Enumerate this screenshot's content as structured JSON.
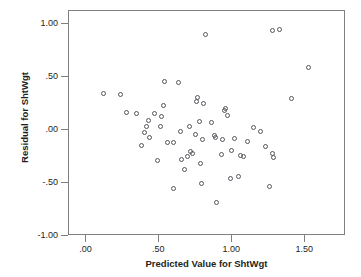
{
  "chart_data": {
    "type": "scatter",
    "title": "",
    "xlabel": "Predicted Value for ShtWgt",
    "ylabel": "Residual for ShtWgt",
    "xlim": [
      -0.12,
      1.78
    ],
    "ylim": [
      -1.0,
      1.12
    ],
    "grid": false,
    "legend": null,
    "marker": "open-circle",
    "marker_color": "#55555c",
    "xticks": [
      0.0,
      0.5,
      1.0,
      1.5
    ],
    "xtick_labels": [
      ".00",
      ".50",
      "1.00",
      "1.50"
    ],
    "yticks": [
      -1.0,
      -0.5,
      0.0,
      0.5,
      1.0
    ],
    "ytick_labels": [
      "-1.00",
      "-.50",
      ".00",
      ".50",
      "1.00"
    ],
    "series": [
      {
        "name": "residuals",
        "points": [
          [
            0.12,
            0.345
          ],
          [
            0.235,
            0.332
          ],
          [
            0.275,
            0.168
          ],
          [
            0.345,
            0.155
          ],
          [
            0.375,
            -0.145
          ],
          [
            0.395,
            -0.025
          ],
          [
            0.41,
            0.03
          ],
          [
            0.425,
            0.092
          ],
          [
            0.435,
            -0.075
          ],
          [
            0.465,
            0.15
          ],
          [
            0.49,
            -0.29
          ],
          [
            0.505,
            0.035
          ],
          [
            0.515,
            0.128
          ],
          [
            0.525,
            0.225
          ],
          [
            0.535,
            0.455
          ],
          [
            0.555,
            -0.118
          ],
          [
            0.595,
            -0.115
          ],
          [
            0.6,
            -0.555
          ],
          [
            0.63,
            0.445
          ],
          [
            0.645,
            -0.018
          ],
          [
            0.655,
            -0.275
          ],
          [
            0.67,
            -0.37
          ],
          [
            0.695,
            -0.255
          ],
          [
            0.705,
            0.03
          ],
          [
            0.715,
            -0.205
          ],
          [
            0.725,
            -0.225
          ],
          [
            0.745,
            -0.04
          ],
          [
            0.755,
            0.265
          ],
          [
            0.76,
            0.305
          ],
          [
            0.775,
            0.075
          ],
          [
            0.785,
            -0.315
          ],
          [
            0.79,
            -0.505
          ],
          [
            0.795,
            -0.095
          ],
          [
            0.805,
            0.245
          ],
          [
            0.815,
            0.895
          ],
          [
            0.86,
            0.065
          ],
          [
            0.875,
            -0.055
          ],
          [
            0.885,
            -0.075
          ],
          [
            0.89,
            -0.685
          ],
          [
            0.925,
            -0.235
          ],
          [
            0.935,
            -0.095
          ],
          [
            0.945,
            0.185
          ],
          [
            0.955,
            0.2
          ],
          [
            0.965,
            0.14
          ],
          [
            0.985,
            -0.455
          ],
          [
            0.995,
            -0.19
          ],
          [
            1.015,
            -0.08
          ],
          [
            1.045,
            -0.44
          ],
          [
            1.055,
            -0.245
          ],
          [
            1.08,
            -0.255
          ],
          [
            1.105,
            -0.105
          ],
          [
            1.145,
            0.02
          ],
          [
            1.195,
            -0.02
          ],
          [
            1.225,
            -0.155
          ],
          [
            1.255,
            -0.535
          ],
          [
            1.275,
            -0.225
          ],
          [
            1.285,
            -0.265
          ],
          [
            1.275,
            0.935
          ],
          [
            1.325,
            0.945
          ],
          [
            1.405,
            0.295
          ],
          [
            1.525,
            0.585
          ]
        ]
      }
    ]
  },
  "axis": {
    "x_title": "Predicted Value for ShtWgt",
    "y_title": "Residual for ShtWgt"
  }
}
